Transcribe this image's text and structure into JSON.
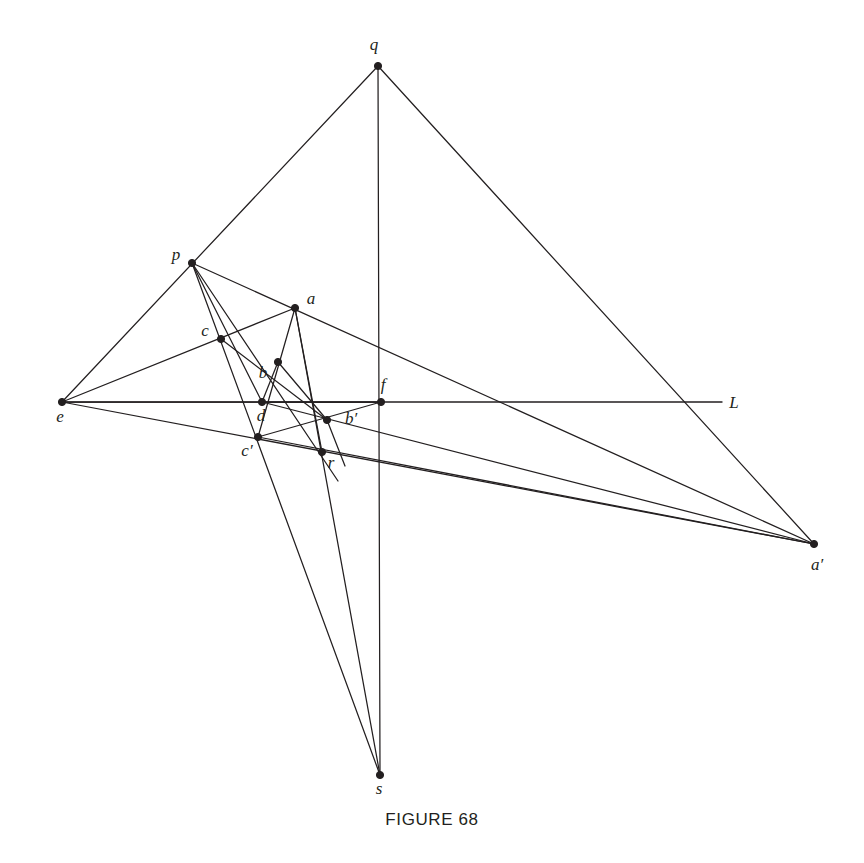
{
  "figure": {
    "caption": "FIGURE 68",
    "ink_color": "#231f20",
    "background_color": "#ffffff",
    "width": 864,
    "height": 863
  },
  "axis": {
    "name": "L",
    "label": "L",
    "label_x": 734,
    "label_y": 408,
    "x1": 62,
    "y1": 402,
    "x2": 722,
    "y2": 402
  },
  "points": [
    {
      "id": "q",
      "label": "q",
      "x": 378,
      "y": 66,
      "lx": 374,
      "ly": 50,
      "anchor": "middle"
    },
    {
      "id": "p",
      "label": "p",
      "x": 192,
      "y": 263,
      "lx": 176,
      "ly": 260,
      "anchor": "middle"
    },
    {
      "id": "a",
      "label": "a",
      "x": 295,
      "y": 308,
      "lx": 311,
      "ly": 304,
      "anchor": "middle"
    },
    {
      "id": "c",
      "label": "c",
      "x": 221,
      "y": 339,
      "lx": 205,
      "ly": 336,
      "anchor": "middle"
    },
    {
      "id": "b",
      "label": "b",
      "x": 278,
      "y": 362,
      "lx": 263,
      "ly": 378,
      "anchor": "middle"
    },
    {
      "id": "f",
      "label": "f",
      "x": 381,
      "y": 402,
      "lx": 383,
      "ly": 390,
      "anchor": "middle"
    },
    {
      "id": "e",
      "label": "e",
      "x": 62,
      "y": 402,
      "lx": 60,
      "ly": 422,
      "anchor": "middle"
    },
    {
      "id": "d",
      "label": "d",
      "x": 262,
      "y": 402,
      "lx": 261,
      "ly": 421,
      "anchor": "middle"
    },
    {
      "id": "bp",
      "label": "b′",
      "x": 327,
      "y": 420,
      "lx": 351,
      "ly": 424,
      "anchor": "middle"
    },
    {
      "id": "cp",
      "label": "c′",
      "x": 258,
      "y": 437,
      "lx": 247,
      "ly": 456,
      "anchor": "middle"
    },
    {
      "id": "r",
      "label": "r",
      "x": 322,
      "y": 452,
      "lx": 331,
      "ly": 468,
      "anchor": "middle"
    },
    {
      "id": "ap",
      "label": "a′",
      "x": 814,
      "y": 544,
      "lx": 817,
      "ly": 570,
      "anchor": "middle"
    },
    {
      "id": "s",
      "label": "s",
      "x": 380,
      "y": 775,
      "lx": 379,
      "ly": 794,
      "anchor": "middle"
    }
  ],
  "segments": [
    {
      "name": "e-to-p-to-q",
      "x1": 62,
      "y1": 402,
      "x2": 378,
      "y2": 66
    },
    {
      "name": "q-to-a-to-s",
      "x1": 378,
      "y1": 66,
      "x2": 380,
      "y2": 775
    },
    {
      "name": "q-to-aprime",
      "x1": 378,
      "y1": 66,
      "x2": 814,
      "y2": 544
    },
    {
      "name": "e-to-c-to-a-to-f",
      "x1": 62,
      "y1": 402,
      "x2": 381,
      "y2": 402
    },
    {
      "name": "p-to-a-to-aprime",
      "x1": 192,
      "y1": 263,
      "x2": 814,
      "y2": 544
    },
    {
      "name": "p-to-c-to-cprime",
      "x1": 192,
      "y1": 263,
      "x2": 380,
      "y2": 775
    },
    {
      "name": "p-to-b-to-r",
      "x1": 192,
      "y1": 263,
      "x2": 338,
      "y2": 481
    },
    {
      "name": "p-to-d",
      "x1": 192,
      "y1": 263,
      "x2": 262,
      "y2": 402
    },
    {
      "name": "e-to-cprime-to-r-to-aprime",
      "x1": 62,
      "y1": 402,
      "x2": 814,
      "y2": 544
    },
    {
      "name": "e-to-c-to-a",
      "x1": 62,
      "y1": 402,
      "x2": 295,
      "y2": 308
    },
    {
      "name": "c-to-bprime",
      "x1": 221,
      "y1": 339,
      "x2": 327,
      "y2": 420
    },
    {
      "name": "b-to-d",
      "x1": 278,
      "y1": 362,
      "x2": 262,
      "y2": 402
    },
    {
      "name": "b-to-bprime",
      "x1": 278,
      "y1": 362,
      "x2": 327,
      "y2": 420
    },
    {
      "name": "a-to-b-to-cprime",
      "x1": 295,
      "y1": 308,
      "x2": 258,
      "y2": 437
    },
    {
      "name": "a-to-bprime-to-s",
      "x1": 295,
      "y1": 308,
      "x2": 380,
      "y2": 775
    },
    {
      "name": "a-to-r",
      "x1": 295,
      "y1": 308,
      "x2": 322,
      "y2": 452
    },
    {
      "name": "d-to-f",
      "x1": 262,
      "y1": 402,
      "x2": 381,
      "y2": 402
    },
    {
      "name": "d-to-bprime-to-aprime",
      "x1": 262,
      "y1": 402,
      "x2": 814,
      "y2": 544
    },
    {
      "name": "cprime-to-bprime-to-f",
      "x1": 258,
      "y1": 437,
      "x2": 381,
      "y2": 402
    },
    {
      "name": "bprime-to-r-extend",
      "x1": 327,
      "y1": 420,
      "x2": 345,
      "y2": 466
    },
    {
      "name": "cprime-to-r-to-aprime-lower",
      "x1": 258,
      "y1": 437,
      "x2": 814,
      "y2": 544
    }
  ]
}
